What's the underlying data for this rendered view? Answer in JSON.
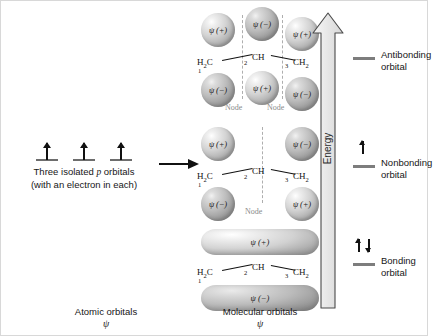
{
  "diagram": {
    "left": {
      "caption_line1_pre": "Three isolated ",
      "caption_line1_italic": "p",
      "caption_line1_post": " orbitals",
      "caption_line2": "(with an electron in each)",
      "orbital_count": 3,
      "electrons_each": 1
    },
    "transform_arrow": "→",
    "skeleton": {
      "c1": "H2C",
      "c1_html": "H₂C",
      "c2": "CH",
      "c3": "CH2",
      "c3_html": "CH₂",
      "num1": "1",
      "num2": "2",
      "num3": "3"
    },
    "levels": [
      {
        "id": "antibonding",
        "name": "Antibonding",
        "label_line1": "Antibonding",
        "label_line2": "orbital",
        "top_lobes": [
          "ψ (+)",
          "ψ (−)",
          "ψ (+)"
        ],
        "bottom_lobes": [
          "ψ (−)",
          "ψ (+)",
          "ψ (−)"
        ],
        "nodes": [
          "Node",
          "Node"
        ],
        "node_count": 2,
        "electrons": 0,
        "electron_arrows": []
      },
      {
        "id": "nonbonding",
        "name": "Nonbonding",
        "label_line1": "Nonbonding",
        "label_line2": "orbital",
        "top_lobes": [
          "ψ (+)",
          "",
          "ψ (−)"
        ],
        "bottom_lobes": [
          "ψ (−)",
          "",
          "ψ (+)"
        ],
        "nodes": [
          "Node"
        ],
        "node_count": 1,
        "electrons": 1,
        "electron_arrows": [
          "up"
        ]
      },
      {
        "id": "bonding",
        "name": "Bonding",
        "label_line1": "Bonding",
        "label_line2": "orbital",
        "top_lobes": [
          "ψ (+)"
        ],
        "bottom_lobes": [
          "ψ (−)"
        ],
        "nodes": [],
        "node_count": 0,
        "electrons": 2,
        "electron_arrows": [
          "up",
          "down"
        ]
      }
    ],
    "energy_axis": {
      "label": "Energy",
      "direction": "up"
    },
    "footer": {
      "atomic_line1": "Atomic orbitals",
      "atomic_line2": "ψ",
      "molecular_line1": "Molecular orbitals",
      "molecular_line2": "ψ"
    },
    "colors": {
      "lobe_positive": "#d3d3d3",
      "lobe_negative": "#bdbdbd",
      "node_line": "#aeaeae",
      "level_bar": "#7d7d7d",
      "text": "#161616",
      "arrow": "#111111"
    }
  }
}
